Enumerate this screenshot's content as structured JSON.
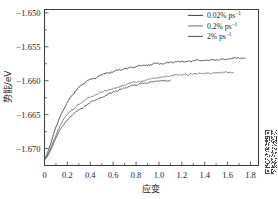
{
  "chart_data": {
    "type": "line",
    "title": "",
    "xlabel": "应变",
    "ylabel": "势能/eV",
    "xlim": [
      0,
      1.87
    ],
    "ylim": [
      -1.6725,
      -1.6495
    ],
    "xticks": [
      0,
      0.2,
      0.4,
      0.6,
      0.8,
      1.0,
      1.2,
      1.4,
      1.6,
      1.8
    ],
    "xticklabels": [
      "0",
      "0.2",
      "0.4",
      "0.6",
      "0.8",
      "1.0",
      "1.2",
      "1.4",
      "1.6",
      "1.8"
    ],
    "yticks": [
      -1.65,
      -1.655,
      -1.66,
      -1.665,
      -1.67
    ],
    "yticklabels": [
      "-1.650",
      "-1.655",
      "-1.660",
      "-1.665",
      "-1.670"
    ],
    "minor_x_ticks_between": 1,
    "minor_y_ticks_between": 1,
    "grid": false,
    "legend_position": "top-right",
    "series": [
      {
        "name": "0.02% ps",
        "name_exponent": "-1",
        "color": "#3c3c3c",
        "x": [
          0.0,
          0.02,
          0.04,
          0.06,
          0.08,
          0.1,
          0.12,
          0.14,
          0.16,
          0.18,
          0.2,
          0.22,
          0.24,
          0.26,
          0.28,
          0.3,
          0.32,
          0.34,
          0.36,
          0.38,
          0.4,
          0.44,
          0.48,
          0.52,
          0.56,
          0.6,
          0.64,
          0.68,
          0.72,
          0.76,
          0.8,
          0.84,
          0.88,
          0.92,
          0.96,
          1.0,
          1.04,
          1.08,
          1.12,
          1.16,
          1.2,
          1.24,
          1.28,
          1.32,
          1.36,
          1.4,
          1.44,
          1.48,
          1.52,
          1.56,
          1.6,
          1.64,
          1.68,
          1.72,
          1.75
        ],
        "y": [
          -1.6715,
          -1.6709,
          -1.67,
          -1.669,
          -1.6678,
          -1.6668,
          -1.666,
          -1.6651,
          -1.6644,
          -1.6638,
          -1.6632,
          -1.6626,
          -1.6622,
          -1.6617,
          -1.6613,
          -1.661,
          -1.6607,
          -1.6604,
          -1.6602,
          -1.66,
          -1.6598,
          -1.6596,
          -1.6593,
          -1.659,
          -1.6588,
          -1.6587,
          -1.6585,
          -1.6583,
          -1.6582,
          -1.658,
          -1.658,
          -1.6578,
          -1.6577,
          -1.6577,
          -1.6575,
          -1.6575,
          -1.6574,
          -1.6573,
          -1.6573,
          -1.6572,
          -1.6572,
          -1.6571,
          -1.6571,
          -1.657,
          -1.657,
          -1.657,
          -1.6569,
          -1.6569,
          -1.6569,
          -1.6568,
          -1.6568,
          -1.6568,
          -1.6567,
          -1.6567,
          -1.6567
        ]
      },
      {
        "name": "0.2% ps",
        "name_exponent": "-1",
        "color": "#6e6e6e",
        "x": [
          0.0,
          0.02,
          0.04,
          0.06,
          0.08,
          0.1,
          0.12,
          0.14,
          0.16,
          0.18,
          0.2,
          0.22,
          0.24,
          0.26,
          0.28,
          0.3,
          0.34,
          0.38,
          0.42,
          0.46,
          0.5,
          0.54,
          0.58,
          0.62,
          0.66,
          0.7,
          0.74,
          0.78,
          0.82,
          0.86,
          0.9,
          0.94,
          0.98,
          1.02,
          1.06,
          1.1,
          1.14,
          1.18,
          1.22,
          1.26,
          1.3,
          1.34,
          1.38,
          1.42,
          1.46,
          1.5,
          1.54,
          1.58,
          1.62,
          1.65
        ],
        "y": [
          -1.6716,
          -1.6712,
          -1.6705,
          -1.6697,
          -1.6688,
          -1.668,
          -1.6672,
          -1.6665,
          -1.6659,
          -1.6654,
          -1.665,
          -1.6646,
          -1.6643,
          -1.664,
          -1.6637,
          -1.6634,
          -1.663,
          -1.6626,
          -1.6623,
          -1.662,
          -1.6617,
          -1.6614,
          -1.6612,
          -1.661,
          -1.6608,
          -1.6606,
          -1.6604,
          -1.6602,
          -1.6601,
          -1.66,
          -1.6598,
          -1.6597,
          -1.6596,
          -1.6595,
          -1.6594,
          -1.6593,
          -1.6592,
          -1.6592,
          -1.6591,
          -1.6591,
          -1.659,
          -1.659,
          -1.6589,
          -1.6589,
          -1.6589,
          -1.6588,
          -1.6588,
          -1.6588,
          -1.6588,
          -1.6588
        ]
      },
      {
        "name": "2% ps",
        "name_exponent": "-1",
        "color": "#4a4a4a",
        "x": [
          0.0,
          0.02,
          0.04,
          0.06,
          0.08,
          0.1,
          0.12,
          0.14,
          0.16,
          0.18,
          0.2,
          0.22,
          0.24,
          0.26,
          0.28,
          0.3,
          0.34,
          0.38,
          0.42,
          0.46,
          0.5,
          0.54,
          0.58,
          0.62,
          0.66,
          0.7,
          0.74,
          0.78,
          0.82,
          0.86,
          0.9,
          0.94,
          0.98,
          1.02,
          1.06,
          1.1
        ],
        "y": [
          -1.6717,
          -1.6713,
          -1.6707,
          -1.67,
          -1.6692,
          -1.6684,
          -1.6677,
          -1.6671,
          -1.6666,
          -1.6662,
          -1.6658,
          -1.6655,
          -1.6652,
          -1.6649,
          -1.6646,
          -1.6644,
          -1.6639,
          -1.6635,
          -1.6631,
          -1.6627,
          -1.6624,
          -1.6621,
          -1.6618,
          -1.6616,
          -1.6613,
          -1.6611,
          -1.6609,
          -1.6607,
          -1.6606,
          -1.6604,
          -1.6603,
          -1.6602,
          -1.6601,
          -1.66,
          -1.66,
          -1.6599
        ]
      }
    ],
    "noise_amplitude": 0.00018
  },
  "legend": {
    "entries": [
      {
        "label": "0.02% ps",
        "exponent": "-1"
      },
      {
        "label": "0.2% ps",
        "exponent": "-1"
      },
      {
        "label": "2% ps",
        "exponent": "-1"
      }
    ]
  },
  "watermark": {
    "name": "qr-code-watermark"
  }
}
